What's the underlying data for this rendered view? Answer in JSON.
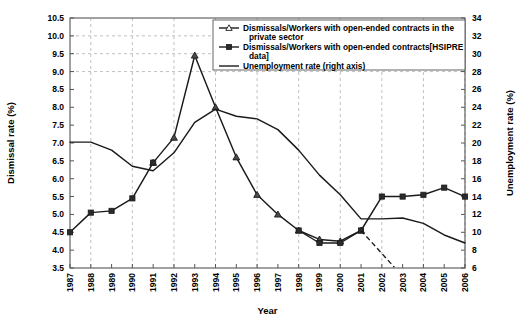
{
  "chart_data": {
    "type": "line",
    "title": "",
    "xlabel": "Year",
    "ylabel": "Dismissal rate (%)",
    "y2label": "Unemployment rate (%)",
    "xlim": [
      1987,
      2006
    ],
    "ylim": [
      3.5,
      10.5
    ],
    "y2lim": [
      6,
      34
    ],
    "grid": "dashed vertical gridlines every 2 years; horizontal dashed gridlines at 9.0, 9.5, 10.0",
    "legend_position": "top-right inside plot",
    "x": [
      1987,
      1988,
      1989,
      1990,
      1991,
      1992,
      1993,
      1994,
      1995,
      1996,
      1997,
      1998,
      1999,
      2000,
      2001,
      2002,
      2003,
      2004,
      2005,
      2006
    ],
    "xtick_labels": [
      "1987",
      "1988",
      "1989",
      "1990",
      "1991",
      "1992",
      "1993",
      "1994",
      "1995",
      "1996",
      "1997",
      "1998",
      "1999",
      "2000",
      "2001",
      "2002",
      "2003",
      "2004",
      "2005",
      "2006"
    ],
    "ytick_labels": [
      "3.5",
      "4.0",
      "4.5",
      "5.0",
      "5.5",
      "6.0",
      "6.5",
      "7.0",
      "7.5",
      "8.0",
      "8.5",
      "9.0",
      "9.5",
      "10.0",
      "10.5"
    ],
    "y2tick_labels": [
      "6",
      "8",
      "10",
      "12",
      "14",
      "16",
      "18",
      "20",
      "22",
      "24",
      "26",
      "28",
      "30",
      "32",
      "34"
    ],
    "series": [
      {
        "name": "Dismissals/Workers with open-ended contracts in the private sector",
        "marker": "triangle",
        "axis": "left",
        "values": [
          null,
          null,
          null,
          null,
          6.45,
          7.15,
          9.45,
          8.0,
          6.6,
          5.55,
          5.0,
          4.55,
          4.3,
          4.25,
          4.55,
          null,
          null,
          null,
          null,
          null
        ]
      },
      {
        "name": "Dismissals/Workers with open-ended contracts[HSIPRE data]",
        "marker": "square",
        "axis": "left",
        "values": [
          4.5,
          5.05,
          5.1,
          5.45,
          6.45,
          null,
          null,
          null,
          null,
          null,
          null,
          4.55,
          4.2,
          4.2,
          4.55,
          5.5,
          5.5,
          5.55,
          5.75,
          5.5
        ]
      },
      {
        "name": "Unemployment rate (right axis)",
        "marker": "none",
        "axis": "right",
        "values": [
          20.1,
          20.1,
          19.2,
          17.4,
          16.9,
          18.9,
          22.3,
          23.8,
          23.0,
          22.7,
          21.5,
          19.2,
          16.4,
          14.2,
          11.5,
          11.5,
          11.6,
          11.0,
          9.7,
          8.8
        ]
      }
    ],
    "annotations": [
      {
        "type": "dashed-segment",
        "series": "Unemployment rate (right axis)",
        "from_x": 2001,
        "to_x": 2002.6,
        "note": "short dashed branch descending below the 2001 node"
      }
    ]
  },
  "legend": {
    "items": [
      {
        "label_line1": "Dismissals/Workers with open-ended contracts in the",
        "label_line2": "private sector",
        "marker": "triangle"
      },
      {
        "label_line1": "Dismissals/Workers with open-ended contracts[HSIPRE",
        "label_line2": "data]",
        "marker": "square"
      },
      {
        "label_line1": "Unemployment rate (right axis)",
        "label_line2": "",
        "marker": "line"
      }
    ]
  },
  "colors": {
    "line": "#1a1a1a",
    "grid": "#b9b9b9",
    "frame": "#555555",
    "background": "#ffffff"
  }
}
